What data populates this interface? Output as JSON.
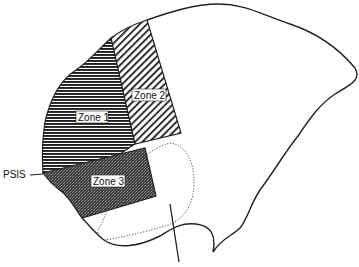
{
  "diagram": {
    "type": "anatomical-zone-diagram",
    "labels": {
      "zone1": "Zone 1",
      "zone2": "Zone 2",
      "zone3": "Zone 3",
      "psis": "PSIS"
    },
    "zones": [
      {
        "id": "zone1",
        "label": "Zone 1",
        "fill_pattern": "horizontal-lines",
        "color": "#222222"
      },
      {
        "id": "zone2",
        "label": "Zone 2",
        "fill_pattern": "diagonal-hatch",
        "color": "#222222"
      },
      {
        "id": "zone3",
        "label": "Zone 3",
        "fill_pattern": "dense-stipple",
        "color": "#333333"
      }
    ],
    "annotations": [
      {
        "id": "psis-leader",
        "label": "PSIS",
        "type": "leader-line"
      },
      {
        "id": "sciatic-notch-outline",
        "type": "dotted-oval"
      },
      {
        "id": "vertical-marker",
        "type": "line"
      }
    ],
    "colors": {
      "outline": "#222222",
      "background": "#ffffff"
    }
  }
}
